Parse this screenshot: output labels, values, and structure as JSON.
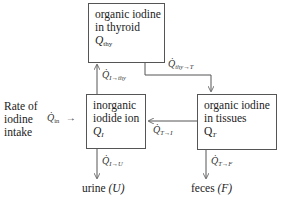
{
  "boxes": {
    "thyroid": {
      "line1": "organic iodine",
      "line2": "in thyroid",
      "symbol": "Q",
      "sub": "thy"
    },
    "inorganic": {
      "line1": "inorganic",
      "line2": "iodide ion",
      "symbol": "Q",
      "sub": "I"
    },
    "tissues": {
      "line1": "organic iodine",
      "line2": "in tissues",
      "symbol": "Q",
      "sub": "T"
    }
  },
  "intake": {
    "line1": "Rate of",
    "line2": "iodine",
    "line3": "intake",
    "flow_symbol": "Q̇",
    "flow_sub": "in",
    "arrow": "→"
  },
  "flows": {
    "i_to_thy": {
      "symbol": "Q̇",
      "sub": "I→thy"
    },
    "thy_to_t": {
      "symbol": "Q̇",
      "sub": "thy→T"
    },
    "t_to_i": {
      "symbol": "Q̇",
      "sub": "T→I"
    },
    "i_to_u": {
      "symbol": "Q̇",
      "sub": "I→U"
    },
    "t_to_f": {
      "symbol": "Q̇",
      "sub": "T→F"
    }
  },
  "outputs": {
    "urine": {
      "label": "urine",
      "symbol": "(U)"
    },
    "feces": {
      "label": "feces",
      "symbol": "(F)"
    }
  }
}
